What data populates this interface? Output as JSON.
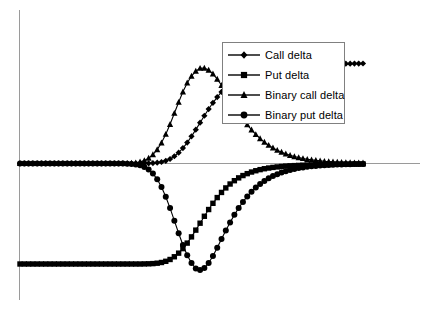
{
  "chart_data": {
    "type": "line",
    "title": "",
    "subtitle": "",
    "xlabel": "",
    "ylabel": "",
    "xlim": [
      0,
      200
    ],
    "ylim": [
      -1.15,
      1.15
    ],
    "grid": false,
    "axes": {
      "zero_line_visible": true,
      "y_axis_visible": true,
      "x_axis_visible": true,
      "tick_labels_x": [],
      "tick_labels_y": []
    },
    "legend": {
      "position": "top-right",
      "border": true,
      "entries": [
        {
          "label": "Call delta",
          "marker": "diamond",
          "color": "#000000"
        },
        {
          "label": "Put delta",
          "marker": "square",
          "color": "#000000"
        },
        {
          "label": "Binary call delta",
          "marker": "triangle",
          "color": "#000000"
        },
        {
          "label": "Binary put delta",
          "marker": "circle",
          "color": "#000000"
        }
      ]
    },
    "x": [
      0,
      2.5,
      5,
      7.5,
      10,
      12.5,
      15,
      17.5,
      20,
      22.5,
      25,
      27.5,
      30,
      32.5,
      35,
      37.5,
      40,
      42.5,
      45,
      47.5,
      50,
      52.5,
      55,
      57.5,
      60,
      62.5,
      65,
      67.5,
      70,
      72.5,
      75,
      77.5,
      80,
      82.5,
      85,
      87.5,
      90,
      92.5,
      95,
      97.5,
      100,
      102.5,
      105,
      107.5,
      110,
      112.5,
      115,
      117.5,
      120,
      122.5,
      125,
      127.5,
      130,
      132.5,
      135,
      137.5,
      140,
      142.5,
      145,
      147.5,
      150,
      152.5,
      155,
      157.5,
      160,
      162.5,
      165,
      167.5,
      170,
      172.5,
      175,
      177.5,
      180,
      182.5,
      185,
      187.5,
      190,
      192.5,
      195,
      197.5,
      200
    ],
    "series": [
      {
        "name": "Call delta",
        "marker": "diamond",
        "color": "#000000",
        "values": [
          0,
          0,
          0,
          0,
          0,
          0,
          0,
          0,
          0,
          0,
          0,
          0,
          0,
          0,
          0,
          0,
          0,
          0,
          0,
          0,
          0,
          0,
          0,
          0,
          0,
          0,
          0,
          0,
          0,
          0.001,
          0.002,
          0.004,
          0.008,
          0.015,
          0.027,
          0.045,
          0.072,
          0.108,
          0.153,
          0.208,
          0.27,
          0.337,
          0.406,
          0.475,
          0.542,
          0.604,
          0.661,
          0.712,
          0.757,
          0.796,
          0.829,
          0.857,
          0.88,
          0.899,
          0.915,
          0.928,
          0.939,
          0.948,
          0.955,
          0.961,
          0.966,
          0.97,
          0.974,
          0.977,
          0.979,
          0.981,
          0.983,
          0.985,
          0.986,
          0.987,
          0.988,
          0.989,
          0.99,
          0.991,
          0.992,
          0.992,
          0.993,
          0.993,
          0.994,
          0.994,
          0.995
        ]
      },
      {
        "name": "Put delta",
        "marker": "square",
        "color": "#000000",
        "values": [
          -1,
          -1,
          -1,
          -1,
          -1,
          -1,
          -1,
          -1,
          -1,
          -1,
          -1,
          -1,
          -1,
          -1,
          -1,
          -1,
          -1,
          -1,
          -1,
          -1,
          -1,
          -1,
          -1,
          -1,
          -1,
          -1,
          -1,
          -1,
          -1,
          -0.999,
          -0.998,
          -0.996,
          -0.992,
          -0.985,
          -0.973,
          -0.955,
          -0.928,
          -0.892,
          -0.847,
          -0.792,
          -0.73,
          -0.663,
          -0.594,
          -0.525,
          -0.458,
          -0.396,
          -0.339,
          -0.288,
          -0.243,
          -0.204,
          -0.171,
          -0.143,
          -0.12,
          -0.101,
          -0.085,
          -0.072,
          -0.061,
          -0.052,
          -0.045,
          -0.039,
          -0.034,
          -0.03,
          -0.026,
          -0.023,
          -0.021,
          -0.019,
          -0.017,
          -0.015,
          -0.014,
          -0.013,
          -0.012,
          -0.011,
          -0.01,
          -0.009,
          -0.008,
          -0.008,
          -0.007,
          -0.007,
          -0.006,
          -0.006,
          -0.005
        ]
      },
      {
        "name": "Binary call delta",
        "marker": "triangle",
        "color": "#000000",
        "values": [
          0,
          0,
          0,
          0,
          0,
          0,
          0,
          0,
          0,
          0,
          0,
          0,
          0,
          0,
          0,
          0,
          0,
          0,
          0,
          0,
          0,
          0,
          0,
          0,
          0.001,
          0.002,
          0.004,
          0.008,
          0.016,
          0.03,
          0.053,
          0.088,
          0.138,
          0.206,
          0.291,
          0.39,
          0.5,
          0.61,
          0.713,
          0.802,
          0.87,
          0.919,
          0.948,
          0.95,
          0.93,
          0.892,
          0.84,
          0.778,
          0.71,
          0.64,
          0.571,
          0.505,
          0.443,
          0.386,
          0.335,
          0.289,
          0.248,
          0.213,
          0.182,
          0.155,
          0.132,
          0.113,
          0.096,
          0.081,
          0.069,
          0.059,
          0.05,
          0.042,
          0.036,
          0.031,
          0.026,
          0.022,
          0.019,
          0.016,
          0.014,
          0.012,
          0.01,
          0.009,
          0.008,
          0.007,
          0.006
        ]
      },
      {
        "name": "Binary put delta",
        "marker": "circle",
        "color": "#000000",
        "values": [
          0,
          0,
          0,
          0,
          0,
          0,
          0,
          0,
          0,
          0,
          0,
          0,
          0,
          0,
          0,
          0,
          0,
          0,
          0,
          0,
          0,
          0,
          0,
          0,
          -0.001,
          -0.002,
          -0.004,
          -0.009,
          -0.018,
          -0.034,
          -0.06,
          -0.1,
          -0.157,
          -0.234,
          -0.331,
          -0.444,
          -0.569,
          -0.694,
          -0.811,
          -0.912,
          -0.99,
          -1.045,
          -1.06,
          -1.04,
          -0.99,
          -0.92,
          -0.838,
          -0.752,
          -0.667,
          -0.586,
          -0.511,
          -0.443,
          -0.382,
          -0.328,
          -0.281,
          -0.24,
          -0.204,
          -0.174,
          -0.148,
          -0.125,
          -0.106,
          -0.09,
          -0.076,
          -0.065,
          -0.055,
          -0.046,
          -0.039,
          -0.033,
          -0.028,
          -0.024,
          -0.02,
          -0.017,
          -0.015,
          -0.012,
          -0.011,
          -0.009,
          -0.008,
          -0.007,
          -0.006,
          -0.005,
          -0.004
        ]
      }
    ]
  },
  "legend": {
    "items": [
      {
        "label": "Call delta"
      },
      {
        "label": "Put delta"
      },
      {
        "label": "Binary call delta"
      },
      {
        "label": "Binary put delta"
      }
    ]
  }
}
